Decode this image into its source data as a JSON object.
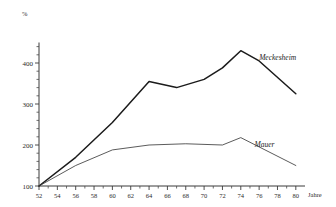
{
  "chart_data": {
    "type": "line",
    "title": "",
    "subtitle": "",
    "xlabel": "Jahre",
    "ylabel": "%",
    "xlim": [
      52,
      81
    ],
    "ylim": [
      100,
      450
    ],
    "grid": false,
    "legend_position": "inline-annotation",
    "x_tick_labels": [
      "52",
      "54",
      "56",
      "58",
      "60",
      "62",
      "64",
      "66",
      "68",
      "70",
      "72",
      "74",
      "76",
      "78",
      "80"
    ],
    "x_tick_values": [
      52,
      54,
      56,
      58,
      60,
      62,
      64,
      66,
      68,
      70,
      72,
      74,
      76,
      78,
      80
    ],
    "x_minor_step": 1,
    "y_tick_labels": [
      "100",
      "200",
      "300",
      "400"
    ],
    "y_tick_values": [
      100,
      200,
      300,
      400
    ],
    "y_minor_step": 20,
    "series": [
      {
        "name": "Meckesheim",
        "style": "thick",
        "x": [
          52,
          56,
          60,
          64,
          67,
          70,
          72,
          74,
          76,
          80
        ],
        "values": [
          100,
          170,
          255,
          355,
          340,
          360,
          388,
          430,
          405,
          325
        ],
        "label_x": 76,
        "label_y": 408
      },
      {
        "name": "Mauer",
        "style": "thin",
        "x": [
          52,
          56,
          60,
          64,
          68,
          72,
          74,
          80
        ],
        "values": [
          100,
          150,
          188,
          200,
          203,
          200,
          218,
          150
        ],
        "label_x": 75.5,
        "label_y": 196
      }
    ],
    "axis_unit_top": "%",
    "axis_unit_right": "Jahre",
    "colors": {
      "axis": "#3a3a3a",
      "series_meckesheim": "#1b1b1b",
      "series_mauer": "#3d3d3d",
      "background": "#ffffff",
      "text": "#2b2b2b"
    }
  }
}
